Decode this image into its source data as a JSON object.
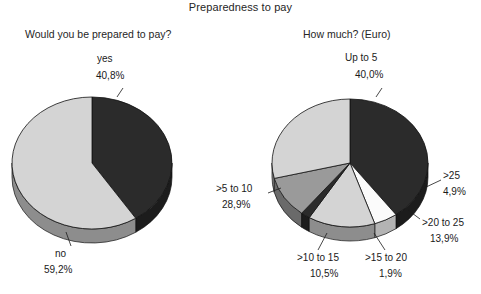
{
  "title": "Preparedness to pay",
  "panels": {
    "left": {
      "subtitle": "Would you be prepared to pay?"
    },
    "right": {
      "subtitle": "How much? (Euro)"
    }
  },
  "colors": {
    "dark": "#2b2b2b",
    "light_gray": "#d4d4d4",
    "mid_gray": "#9a9a9a",
    "white": "#fbfbfb",
    "side_dark": "#1c1c1c",
    "side_light": "#8d8d8d",
    "side_mid": "#6a6a6a",
    "side_white": "#b4b4b4",
    "outline": "#111111",
    "text": "#1a1a1a"
  },
  "labels": {
    "yes_name": "yes",
    "yes_value": "40,8%",
    "no_name": "no",
    "no_value": "59,2%",
    "up_to_5_name": "Up to 5",
    "up_to_5_value": "40,0%",
    "gt25_name": ">25",
    "gt25_value": "4,9%",
    "gt20to25_name": ">20 to 25",
    "gt20to25_value": "13,9%",
    "gt15to20_name": ">15 to 20",
    "gt15to20_value": "1,9%",
    "gt10to15_name": ">10 to 15",
    "gt10to15_value": "10,5%",
    "gt5to10_name": ">5 to 10",
    "gt5to10_value": "28,9%"
  },
  "chart_data": [
    {
      "type": "pie",
      "title": "Would you be prepared to pay?",
      "categories": [
        "yes",
        "no"
      ],
      "values": [
        40.8,
        59.2
      ],
      "value_labels": [
        "40,8%",
        "59,2%"
      ],
      "unit": "percent",
      "legend": "none",
      "three_d": true,
      "start_angle_deg": 0,
      "direction": "clockwise",
      "slice_colors": [
        "#2b2b2b",
        "#d4d4d4"
      ]
    },
    {
      "type": "pie",
      "title": "How much? (Euro)",
      "categories": [
        "Up to 5",
        ">25",
        ">20 to 25",
        ">15 to 20",
        ">10 to 15",
        ">5 to 10"
      ],
      "values": [
        40.0,
        4.9,
        13.9,
        1.9,
        10.5,
        28.9
      ],
      "value_labels": [
        "40,0%",
        "4,9%",
        "13,9%",
        "1,9%",
        "10,5%",
        "28,9%"
      ],
      "unit": "percent",
      "legend": "none",
      "three_d": true,
      "start_angle_deg": 0,
      "direction": "clockwise",
      "slice_colors": [
        "#2b2b2b",
        "#fbfbfb",
        "#d4d4d4",
        "#2b2b2b",
        "#9a9a9a",
        "#d4d4d4"
      ]
    }
  ]
}
